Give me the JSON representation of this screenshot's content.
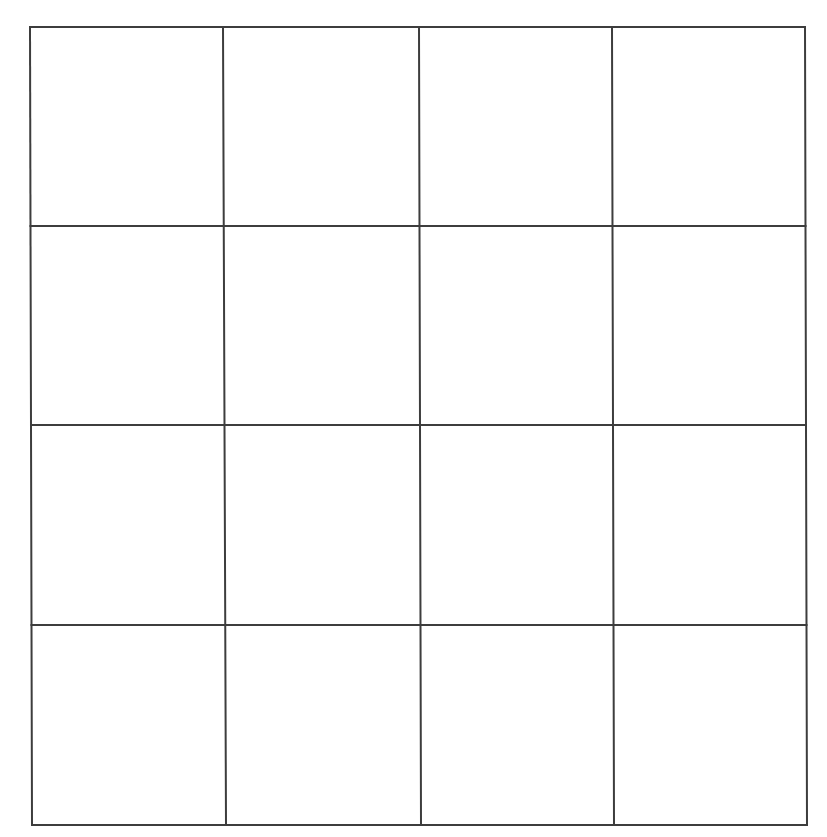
{
  "grid": {
    "rows": 4,
    "columns": 4,
    "line_color": "#3d3d3d",
    "background_color": "#ffffff",
    "line_width": 2,
    "bounds": {
      "left": 30,
      "top": 27,
      "right": 806,
      "bottom": 825
    },
    "vertical_lines_top": [
      30,
      223,
      419,
      612,
      805
    ],
    "vertical_lines_bottom": [
      32,
      226,
      421,
      614,
      807
    ],
    "horizontal_lines": [
      27,
      226,
      425,
      625,
      825
    ],
    "cells": [
      [
        "",
        "",
        "",
        ""
      ],
      [
        "",
        "",
        "",
        ""
      ],
      [
        "",
        "",
        "",
        ""
      ],
      [
        "",
        "",
        "",
        ""
      ]
    ]
  }
}
